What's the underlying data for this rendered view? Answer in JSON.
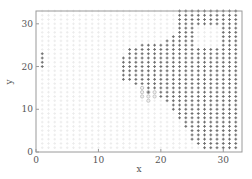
{
  "chart_data": {
    "type": "scatter",
    "title": "",
    "xlabel": "x",
    "ylabel": "y",
    "xlim": [
      0,
      33
    ],
    "ylim": [
      0,
      33
    ],
    "xticks": [
      0,
      10,
      20,
      30
    ],
    "yticks": [
      0,
      10,
      20,
      30
    ],
    "grid": false,
    "legend": null,
    "colors": {
      "axis": "#888888",
      "dark_marker": "#6e6e6e",
      "light_marker": "#ececec",
      "circle_marker": "#bdbdbd",
      "background": "#ffffff"
    },
    "series": [
      {
        "name": "background points (light)",
        "marker": "+",
        "color": "#ececec",
        "description": "faint grid of points covering most of the plot area at integer coordinates",
        "x_range": [
          1,
          32
        ],
        "y_range": [
          1,
          33
        ]
      },
      {
        "name": "dark points",
        "marker": "+",
        "color": "#6e6e6e",
        "columns": [
          {
            "x": 1,
            "y_min": 20,
            "y_max": 23
          },
          {
            "x": 14,
            "y_min": 17,
            "y_max": 22
          },
          {
            "x": 15,
            "y_min": 17,
            "y_max": 24
          },
          {
            "x": 16,
            "y_min": 16,
            "y_max": 24
          },
          {
            "x": 17,
            "y_min": 16,
            "y_max": 25
          },
          {
            "x": 18,
            "y_min": 14,
            "y_max": 25
          },
          {
            "x": 19,
            "y_min": 15,
            "y_max": 25
          },
          {
            "x": 20,
            "y_min": 13,
            "y_max": 25
          },
          {
            "x": 21,
            "y_min": 12,
            "y_max": 26
          },
          {
            "x": 22,
            "y_min": 10,
            "y_max": 27
          },
          {
            "x": 23,
            "y_min": 8,
            "y_max": 33
          },
          {
            "x": 24,
            "y_min": 6,
            "y_max": 33
          },
          {
            "x": 25,
            "y_min": 3,
            "y_max": 33
          },
          {
            "x": 26,
            "y_min": 2,
            "y_max": 33
          },
          {
            "x": 27,
            "y_min": 1,
            "y_max": 33
          },
          {
            "x": 28,
            "y_min": 1,
            "y_max": 33
          },
          {
            "x": 29,
            "y_min": 1,
            "y_max": 33
          },
          {
            "x": 30,
            "y_min": 1,
            "y_max": 33
          },
          {
            "x": 31,
            "y_min": 1,
            "y_max": 33
          },
          {
            "x": 32,
            "y_min": 1,
            "y_max": 33
          }
        ],
        "gaps": [
          {
            "x_min": 26,
            "x_max": 29,
            "y_min": 25,
            "y_max": 29
          }
        ]
      },
      {
        "name": "circle points",
        "marker": "o",
        "color": "#bdbdbd",
        "points": [
          [
            17,
            15
          ],
          [
            17,
            14
          ],
          [
            17,
            13
          ],
          [
            18,
            14
          ],
          [
            18,
            13
          ],
          [
            18,
            12
          ],
          [
            19,
            14
          ],
          [
            19,
            13
          ]
        ]
      }
    ]
  }
}
